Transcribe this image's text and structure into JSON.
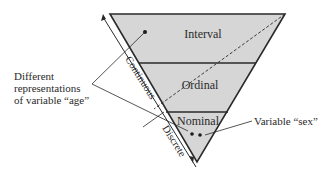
{
  "levels": [
    {
      "name": "Interval"
    },
    {
      "name": "Ordinal"
    },
    {
      "name": "Nominal"
    }
  ],
  "axis": {
    "continuous_label": "Continuous",
    "discrete_label": "Discrete"
  },
  "annotations": {
    "age_line1": "Different",
    "age_line2": "representations",
    "age_line3": "of variable “age”",
    "sex": "Variable “sex”"
  },
  "colors": {
    "fill": "#d6d6d6",
    "stroke": "#2a2a2a"
  }
}
